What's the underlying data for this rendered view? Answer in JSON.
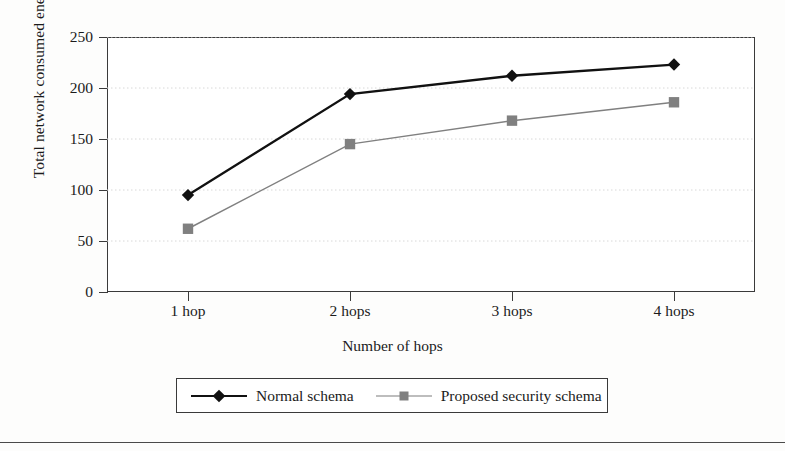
{
  "chart_data": {
    "type": "line",
    "title": "",
    "subtitle": "",
    "xlabel": "Number of hops",
    "ylabel": "Total network consumed energy (J)",
    "categories": [
      "1 hop",
      "2 hops",
      "3 hops",
      "4 hops"
    ],
    "series": [
      {
        "name": "Normal schema",
        "values": [
          95,
          194,
          212,
          223
        ],
        "color": "#111111",
        "marker": "diamond"
      },
      {
        "name": "Proposed security schema",
        "values": [
          62,
          145,
          168,
          186
        ],
        "color": "#808080",
        "marker": "square"
      }
    ],
    "ylim": [
      0,
      250
    ],
    "yticks": [
      0,
      50,
      100,
      150,
      200,
      250
    ],
    "ytick_labels": [
      "0",
      "50",
      "100",
      "150",
      "200",
      "250"
    ],
    "grid": "horizontal-dotted",
    "legend_position": "below-axis-centered"
  },
  "axes": {
    "y_title": "Total network consumed energy (J)",
    "x_title": "Number of hops"
  },
  "legend": {
    "entries": [
      {
        "label": "Normal schema",
        "marker": "diamond-marker",
        "color": "#111111"
      },
      {
        "label": "Proposed security schema",
        "marker": "square-marker",
        "color": "#808080"
      }
    ]
  },
  "colors": {
    "series_normal": "#111111",
    "series_proposed": "#808080",
    "axis": "#3a3a3a",
    "gridline": "#d8d8d8",
    "background": "#ffffff"
  }
}
